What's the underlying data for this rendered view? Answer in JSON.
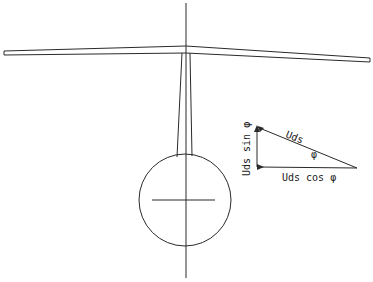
{
  "diagram": {
    "labels": {
      "hypotenuse": "Uds",
      "vertical_component": "Uds sin φ",
      "horizontal_component": "Uds cos φ",
      "angle": "φ"
    },
    "colors": {
      "line": "#2a2a2a",
      "background": "#ffffff"
    }
  }
}
